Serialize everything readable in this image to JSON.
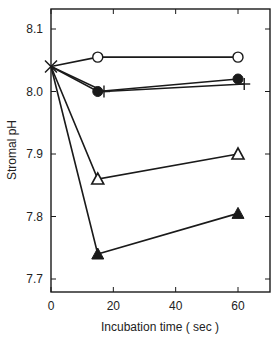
{
  "chart_data": {
    "type": "line",
    "title": "",
    "xlabel": "Incubation time  ( sec )",
    "ylabel": "Stromal pH",
    "xlim": [
      0,
      70
    ],
    "ylim": [
      7.68,
      8.13
    ],
    "xticks": [
      0,
      20,
      40,
      60
    ],
    "xtick_labels": [
      "0",
      "20",
      "40",
      "60"
    ],
    "yticks": [
      7.7,
      7.8,
      7.9,
      8.0,
      8.1
    ],
    "ytick_labels": [
      "7.7",
      "7.8",
      "7.9",
      "8.0",
      "8.1"
    ],
    "grid": false,
    "legend": null,
    "series": [
      {
        "name": "open-circle",
        "marker": "open-circle",
        "x": [
          0,
          15,
          60
        ],
        "y": [
          8.04,
          8.055,
          8.055
        ]
      },
      {
        "name": "filled-circle",
        "marker": "filled-circle",
        "x": [
          0,
          15,
          60
        ],
        "y": [
          8.04,
          8.0,
          8.02
        ]
      },
      {
        "name": "plus",
        "marker": "plus",
        "x": [
          0,
          17,
          62
        ],
        "y": [
          8.04,
          8.0,
          8.012
        ]
      },
      {
        "name": "open-triangle",
        "marker": "open-triangle",
        "x": [
          0,
          15,
          60
        ],
        "y": [
          8.04,
          7.86,
          7.9
        ]
      },
      {
        "name": "filled-triangle",
        "marker": "filled-triangle",
        "x": [
          0,
          15,
          60
        ],
        "y": [
          8.04,
          7.74,
          7.805
        ]
      }
    ],
    "start_marker": {
      "symbol": "x-cross",
      "x": 0,
      "y": 8.04
    }
  },
  "colors": {
    "line": "#1a1a1a",
    "background": "#ffffff"
  }
}
